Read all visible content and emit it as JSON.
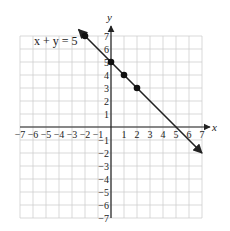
{
  "chart_data": {
    "type": "line",
    "title": "",
    "annotation": "x + y = 5",
    "xlabel": "x",
    "ylabel": "y",
    "xlim": [
      -7,
      7
    ],
    "ylim": [
      -7,
      7
    ],
    "grid": true,
    "x_ticks": [
      -7,
      -6,
      -5,
      -4,
      -3,
      -2,
      -1,
      1,
      2,
      3,
      4,
      5,
      6,
      7
    ],
    "y_ticks": [
      7,
      6,
      5,
      4,
      3,
      2,
      1,
      -1,
      -2,
      -3,
      -4,
      -5,
      -6,
      -7
    ],
    "series": [
      {
        "name": "x + y = 5",
        "line": {
          "from": [
            -2.5,
            7.5
          ],
          "to": [
            7,
            -2
          ],
          "arrows": "both"
        },
        "points": [
          [
            -2,
            7
          ],
          [
            0,
            5
          ],
          [
            1,
            4
          ],
          [
            2,
            3
          ]
        ]
      }
    ]
  },
  "labels": {
    "equation": "x + y = 5",
    "x_axis": "x",
    "y_axis": "y"
  }
}
